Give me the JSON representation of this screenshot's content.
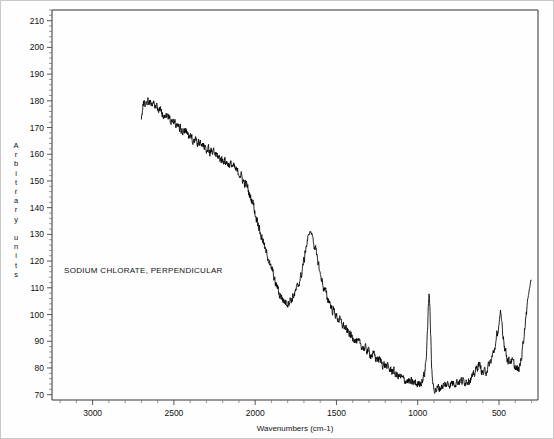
{
  "chart_data": {
    "type": "line",
    "title": "",
    "annotation": "SODIUM CHLORATE, PERPENDICULAR",
    "xlabel": "Wavenumbers (cm-1)",
    "ylabel": "Arbitrary units",
    "ylabel_chars": [
      "A",
      "r",
      "b",
      "i",
      "t",
      "r",
      "a",
      "r",
      "y",
      "",
      "u",
      "n",
      "i",
      "t",
      "s"
    ],
    "xlim": [
      3250,
      260
    ],
    "ylim": [
      68,
      214
    ],
    "x_ticks": [
      3000,
      2500,
      2000,
      1500,
      1000,
      500
    ],
    "x_tick_labels": [
      "3000",
      "2500",
      "2000",
      "1500",
      "1000",
      "500"
    ],
    "x_minor_step": 100,
    "y_ticks": [
      70,
      80,
      90,
      100,
      110,
      120,
      130,
      140,
      150,
      160,
      170,
      180,
      190,
      200,
      210
    ],
    "y_tick_labels": [
      "70",
      "80",
      "90",
      "100",
      "110",
      "120",
      "130",
      "140",
      "150",
      "160",
      "170",
      "180",
      "190",
      "200",
      "210"
    ],
    "y_minor_step": 2,
    "grid": false,
    "legend": "none",
    "series": [
      {
        "name": "Sodium chlorate perpendicular Raman spectrum",
        "color": "#000000",
        "noise_amplitude": 1.9,
        "x_start": 2700,
        "x_end": 300,
        "control_points": [
          [
            2700,
            174.5
          ],
          [
            2685,
            179.0
          ],
          [
            2660,
            180.0
          ],
          [
            2620,
            178.5
          ],
          [
            2560,
            175.0
          ],
          [
            2500,
            172.0
          ],
          [
            2440,
            168.5
          ],
          [
            2380,
            165.5
          ],
          [
            2320,
            163.0
          ],
          [
            2260,
            160.5
          ],
          [
            2200,
            158.0
          ],
          [
            2150,
            156.0
          ],
          [
            2100,
            153.0
          ],
          [
            2060,
            149.0
          ],
          [
            2020,
            143.0
          ],
          [
            1990,
            136.0
          ],
          [
            1960,
            129.0
          ],
          [
            1930,
            123.0
          ],
          [
            1900,
            117.0
          ],
          [
            1870,
            111.0
          ],
          [
            1845,
            107.0
          ],
          [
            1820,
            105.0
          ],
          [
            1800,
            104.5
          ],
          [
            1780,
            105.5
          ],
          [
            1760,
            107.5
          ],
          [
            1740,
            110.0
          ],
          [
            1720,
            114.0
          ],
          [
            1700,
            120.0
          ],
          [
            1685,
            126.0
          ],
          [
            1670,
            130.0
          ],
          [
            1660,
            131.0
          ],
          [
            1650,
            130.0
          ],
          [
            1635,
            126.0
          ],
          [
            1615,
            120.0
          ],
          [
            1595,
            114.0
          ],
          [
            1575,
            109.5
          ],
          [
            1550,
            105.5
          ],
          [
            1520,
            101.5
          ],
          [
            1490,
            98.5
          ],
          [
            1460,
            96.0
          ],
          [
            1430,
            93.5
          ],
          [
            1400,
            91.5
          ],
          [
            1360,
            89.0
          ],
          [
            1320,
            87.0
          ],
          [
            1280,
            85.0
          ],
          [
            1240,
            83.0
          ],
          [
            1200,
            81.0
          ],
          [
            1160,
            79.0
          ],
          [
            1120,
            77.0
          ],
          [
            1080,
            75.5
          ],
          [
            1040,
            74.5
          ],
          [
            1000,
            74.0
          ],
          [
            975,
            75.0
          ],
          [
            960,
            77.5
          ],
          [
            948,
            83.0
          ],
          [
            940,
            94.0
          ],
          [
            934,
            104.0
          ],
          [
            930,
            107.5
          ],
          [
            926,
            104.0
          ],
          [
            920,
            92.0
          ],
          [
            914,
            80.0
          ],
          [
            908,
            74.5
          ],
          [
            900,
            72.5
          ],
          [
            890,
            72.0
          ],
          [
            870,
            72.5
          ],
          [
            840,
            73.5
          ],
          [
            810,
            74.0
          ],
          [
            780,
            74.5
          ],
          [
            750,
            75.0
          ],
          [
            720,
            75.0
          ],
          [
            690,
            75.5
          ],
          [
            660,
            76.5
          ],
          [
            640,
            79.5
          ],
          [
            625,
            81.5
          ],
          [
            612,
            80.0
          ],
          [
            600,
            78.0
          ],
          [
            585,
            78.5
          ],
          [
            570,
            80.0
          ],
          [
            550,
            82.5
          ],
          [
            535,
            85.5
          ],
          [
            520,
            89.0
          ],
          [
            508,
            93.5
          ],
          [
            498,
            97.0
          ],
          [
            490,
            99.5
          ],
          [
            483,
            97.0
          ],
          [
            474,
            92.0
          ],
          [
            462,
            87.0
          ],
          [
            450,
            84.0
          ],
          [
            440,
            82.5
          ],
          [
            428,
            83.0
          ],
          [
            415,
            82.0
          ],
          [
            402,
            80.5
          ],
          [
            392,
            79.5
          ],
          [
            382,
            79.0
          ],
          [
            372,
            80.5
          ],
          [
            362,
            84.0
          ],
          [
            352,
            89.0
          ],
          [
            342,
            95.0
          ],
          [
            332,
            101.0
          ],
          [
            322,
            106.0
          ],
          [
            312,
            110.0
          ],
          [
            303,
            113.0
          ]
        ]
      }
    ]
  },
  "geometry": {
    "plot_left": 51,
    "plot_right": 537,
    "plot_top": 9,
    "plot_bottom": 399
  }
}
